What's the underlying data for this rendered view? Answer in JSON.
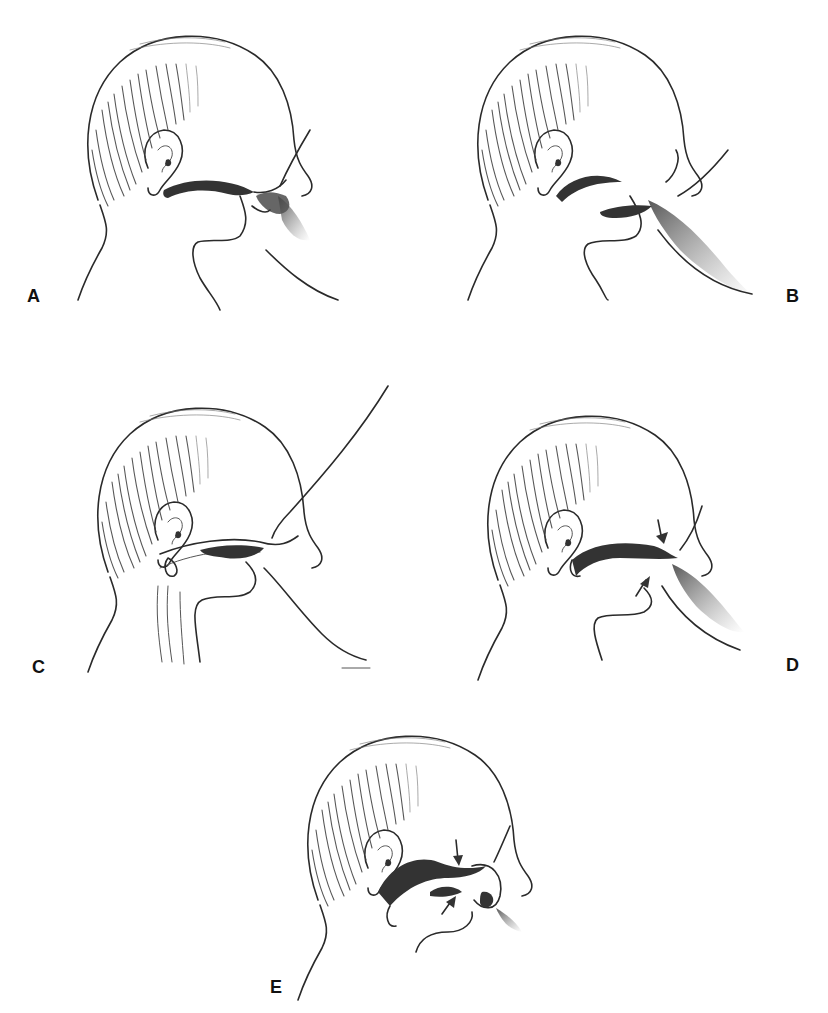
{
  "figure": {
    "background": "#ffffff",
    "ink_color": "#2a2a2a",
    "panels": [
      {
        "id": "A",
        "label": "A",
        "subject": "infant-head-profile-at-breast",
        "mouth": "nipple-at-lips-tongue-retracted"
      },
      {
        "id": "B",
        "label": "B",
        "subject": "infant-head-profile-at-breast",
        "mouth": "tongue-extended-under-nipple"
      },
      {
        "id": "C",
        "label": "C",
        "subject": "infant-head-profile-at-breast",
        "mouth": "wide-gape-nipple-drawn-in-sagittal"
      },
      {
        "id": "D",
        "label": "D",
        "subject": "infant-head-profile-at-breast",
        "mouth": "jaw-compression-arrows-upper-lower"
      },
      {
        "id": "E",
        "label": "E",
        "subject": "infant-head-profile-at-breast",
        "mouth": "tongue-wave-nipple-at-palate-arrows"
      }
    ],
    "icons": {
      "arrow": "downward/upward compression arrow"
    }
  }
}
